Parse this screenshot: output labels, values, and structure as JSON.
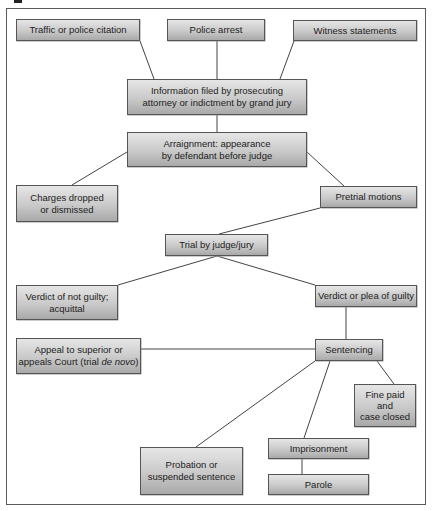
{
  "diagram": {
    "type": "flowchart",
    "title": "",
    "nodes": {
      "traffic": {
        "label": "Traffic or police citation"
      },
      "arrest": {
        "label": "Police arrest"
      },
      "witness": {
        "label": "Witness statements"
      },
      "information": {
        "line1": "Information filed by prosecuting",
        "line2": "attorney or indictment by grand jury"
      },
      "arraignment": {
        "line1": "Arraignment: appearance",
        "line2": "by defendant before judge"
      },
      "charges": {
        "line1": "Charges dropped",
        "line2": "or dismissed"
      },
      "pretrial": {
        "label": "Pretrial motions"
      },
      "trial": {
        "label": "Trial by judge/jury"
      },
      "not_guilty": {
        "line1": "Verdict of not guilty;",
        "line2": "acquittal"
      },
      "guilty": {
        "label": "Verdict or plea of guilty"
      },
      "appeal": {
        "line1": "Appeal to superior or",
        "line2_prefix": "appeals Court (trial ",
        "line2_italic": "de novo",
        "line2_suffix": ")"
      },
      "sentencing": {
        "label": "Sentencing"
      },
      "fine": {
        "line1": "Fine paid",
        "line2": "and",
        "line3": "case closed"
      },
      "probation": {
        "line1": "Probation or",
        "line2": "suspended sentence"
      },
      "imprisonment": {
        "label": "Imprisonment"
      },
      "parole": {
        "label": "Parole"
      }
    },
    "edges": [
      [
        "traffic",
        "information"
      ],
      [
        "arrest",
        "information"
      ],
      [
        "witness",
        "information"
      ],
      [
        "information",
        "arraignment"
      ],
      [
        "arraignment",
        "charges"
      ],
      [
        "arraignment",
        "pretrial"
      ],
      [
        "pretrial",
        "trial"
      ],
      [
        "trial",
        "not_guilty"
      ],
      [
        "trial",
        "guilty"
      ],
      [
        "guilty",
        "sentencing"
      ],
      [
        "appeal",
        "sentencing"
      ],
      [
        "sentencing",
        "probation"
      ],
      [
        "sentencing",
        "imprisonment"
      ],
      [
        "sentencing",
        "fine"
      ],
      [
        "imprisonment",
        "parole"
      ]
    ],
    "colors": {
      "box_fill_top": "#e6e6e6",
      "box_fill_bottom": "#a9a9a9",
      "box_border": "#555555",
      "line": "#444444",
      "frame": "#5a5a5a"
    }
  }
}
